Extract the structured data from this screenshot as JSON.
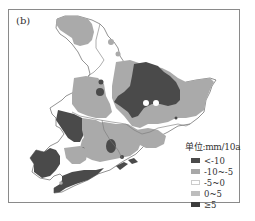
{
  "figure": {
    "panel_label": "(b)"
  },
  "legend": {
    "title": "单位:mm/10a",
    "items": [
      {
        "label": "<-10",
        "color": "#4a4a4a"
      },
      {
        "label": "-10~-5",
        "color": "#a8a8a8"
      },
      {
        "label": "-5~0",
        "color": "#ffffff"
      },
      {
        "label": "0~5",
        "color": "#bdbdbd"
      },
      {
        "label": "≥5",
        "color": "#3c3c3c"
      }
    ]
  },
  "colors": {
    "dark": "#4a4a4a",
    "mid": "#aaaaaa",
    "white": "#ffffff",
    "boundary": "#777777",
    "frame": "#8a8a8a"
  }
}
